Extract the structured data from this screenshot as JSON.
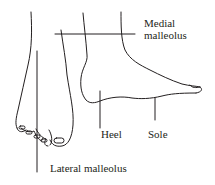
{
  "diagram": {
    "labels": {
      "medial_malleolus_line1": "Medial",
      "medial_malleolus_line2": "malleolus",
      "heel": "Heel",
      "sole": "Sole",
      "lateral_malleolus": "Lateral malleolus"
    },
    "colors": {
      "stroke": "#231f20",
      "background": "#ffffff"
    }
  }
}
